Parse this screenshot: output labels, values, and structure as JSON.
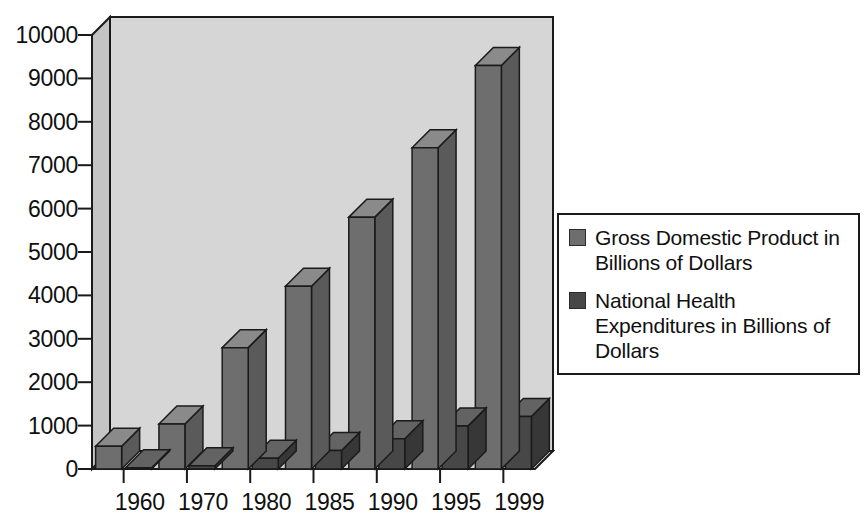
{
  "chart_data": {
    "type": "bar",
    "title": "",
    "subtitle": "",
    "xlabel": "",
    "ylabel": "",
    "categories": [
      "1960",
      "1970",
      "1980",
      "1985",
      "1990",
      "1995",
      "1999"
    ],
    "series": [
      {
        "name": "Gross Domestic Product in Billions of Dollars",
        "color": "#6e6e6e",
        "values": [
          526,
          1038,
          2796,
          4213,
          5803,
          7401,
          9299
        ]
      },
      {
        "name": "National Health Expenditures in Billions of Dollars",
        "color": "#474747",
        "values": [
          27,
          73,
          246,
          428,
          696,
          993,
          1210
        ]
      }
    ],
    "ylim": [
      0,
      10000
    ],
    "yticks": [
      0,
      1000,
      2000,
      3000,
      4000,
      5000,
      6000,
      7000,
      8000,
      9000,
      10000
    ],
    "ytick_labels": [
      "0",
      "1000",
      "2000",
      "3000",
      "4000",
      "5000",
      "6000",
      "7000",
      "8000",
      "9000",
      "10000"
    ],
    "grid": false,
    "legend_position": "right",
    "style": "3d-bar"
  },
  "legend": {
    "items": [
      {
        "label": "Gross Domestic Product in Billions of Dollars",
        "color": "#6e6e6e"
      },
      {
        "label": "National Health Expenditures in Billions of Dollars",
        "color": "#474747"
      }
    ]
  },
  "colors": {
    "gdp_bar_front": "#6e6e6e",
    "gdp_bar_top": "#8a8a8a",
    "gdp_bar_side": "#5a5a5a",
    "nhe_bar_front": "#474747",
    "nhe_bar_top": "#636363",
    "nhe_bar_side": "#373737",
    "plot_wall": "#d4d4d4",
    "plot_floor": "#c9c9c9",
    "outline": "#1a1a1a",
    "text": "#101010",
    "background": "#ffffff"
  }
}
